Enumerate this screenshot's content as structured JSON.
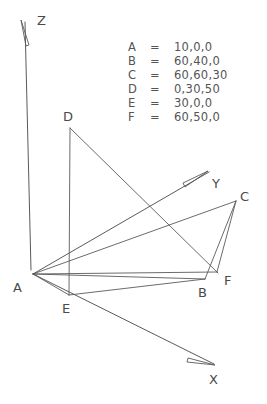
{
  "figure": {
    "background_color": "#ffffff",
    "line_color": "#5a5a5a",
    "text_color": "#555555"
  },
  "legend": {
    "rows": [
      {
        "name": "A",
        "eq": "=",
        "coords": "10,0,0"
      },
      {
        "name": "B",
        "eq": "=",
        "coords": "60,40,0"
      },
      {
        "name": "C",
        "eq": "=",
        "coords": "60,60,30"
      },
      {
        "name": "D",
        "eq": "=",
        "coords": "0,30,50"
      },
      {
        "name": "E",
        "eq": "=",
        "coords": "30,0,0"
      },
      {
        "name": "F",
        "eq": "=",
        "coords": "60,50,0"
      }
    ]
  },
  "axes": [
    {
      "name": "Z",
      "label": "Z"
    },
    {
      "name": "Y",
      "label": "Y"
    },
    {
      "name": "X",
      "label": "X"
    }
  ],
  "points": [
    {
      "name": "A",
      "label": "A"
    },
    {
      "name": "B",
      "label": "B"
    },
    {
      "name": "C",
      "label": "C"
    },
    {
      "name": "D",
      "label": "D"
    },
    {
      "name": "E",
      "label": "E"
    },
    {
      "name": "F",
      "label": "F"
    }
  ],
  "edges": [
    {
      "from": "A",
      "to": "C"
    },
    {
      "from": "C",
      "to": "B"
    },
    {
      "from": "A",
      "to": "F"
    },
    {
      "from": "C",
      "to": "F"
    },
    {
      "from": "E",
      "to": "B"
    },
    {
      "from": "D",
      "to": "E"
    },
    {
      "from": "D",
      "to": "B"
    },
    {
      "from": "A",
      "to": "E"
    },
    {
      "from": "A",
      "to": "B"
    }
  ]
}
